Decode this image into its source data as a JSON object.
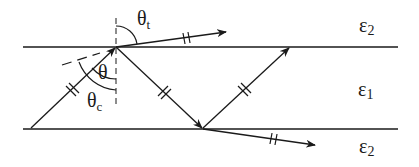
{
  "diagram": {
    "type": "physics-ray-diagram",
    "labels": {
      "theta_t_sym": "θ",
      "theta_t_sub": "t",
      "theta_sym": "θ",
      "theta_c_sym": "θ",
      "theta_c_sub": "c",
      "eps_top_sym": "ε",
      "eps_top_sub": "2",
      "eps_mid_sym": "ε",
      "eps_mid_sub": "1",
      "eps_bot_sym": "ε",
      "eps_bot_sub": "2"
    },
    "colors": {
      "stroke": "#1a1a1a",
      "background": "#ffffff"
    }
  }
}
